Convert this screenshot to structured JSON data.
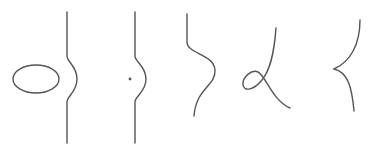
{
  "diagram": {
    "background": "#ffffff",
    "stroke_color": "#555555",
    "stroke_width": 1.4,
    "figures": [
      {
        "id": "ellipse-and-bulging-line",
        "ellipse": {
          "cx": 36,
          "cy": 79,
          "rx": 23,
          "ry": 14
        },
        "line_path": "M67,12 L67,56 C67,62 77,66 77,79 C77,92 67,96 67,102 L67,143"
      },
      {
        "id": "point-and-bulging-line",
        "point": {
          "cx": 130,
          "cy": 79,
          "r": 1.4
        },
        "line_path": "M135,12 L135,56 C135,62 146,66 146,79 C146,92 135,96 135,102 L135,143"
      },
      {
        "id": "s-curve",
        "line_path": "M187,14 L187,42 C187,54 214,54 215,70 C216,86 196,88 194,116"
      },
      {
        "id": "loop-curve",
        "line_path": "M276,28 C274,55 270,70 262,80 C254,90 244,92 243,85 C242,77 252,69 258,72 C266,76 272,100 290,108"
      },
      {
        "id": "cusp-curve",
        "line_path_upper": "M360,20 C360,45 350,62 334,69",
        "line_path_lower": "M334,69 C348,72 352,88 354,111"
      }
    ]
  }
}
